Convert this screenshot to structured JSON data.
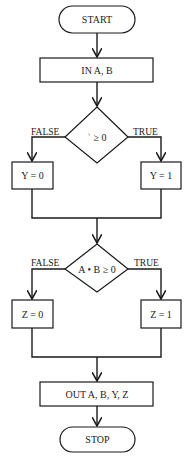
{
  "diagram": {
    "type": "flowchart",
    "nodes": {
      "start": {
        "kind": "terminal",
        "label": "START"
      },
      "input": {
        "kind": "process",
        "label": "IN A, B"
      },
      "decision1": {
        "kind": "decision",
        "label": "ʿ ≥ 0",
        "false_label": "FALSE",
        "true_label": "TRUE"
      },
      "y0": {
        "kind": "process",
        "label": "Y = 0"
      },
      "y1": {
        "kind": "process",
        "label": "Y = 1"
      },
      "decision2": {
        "kind": "decision",
        "label": "A • B ≥ 0",
        "false_label": "FALSE",
        "true_label": "TRUE"
      },
      "z0": {
        "kind": "process",
        "label": "Z = 0"
      },
      "z1": {
        "kind": "process",
        "label": "Z = 1"
      },
      "output": {
        "kind": "process",
        "label": "OUT A, B, Y, Z"
      },
      "stop": {
        "kind": "terminal",
        "label": "STOP"
      }
    },
    "edges": [
      [
        "start",
        "input"
      ],
      [
        "input",
        "decision1"
      ],
      [
        "decision1",
        "y0",
        "FALSE"
      ],
      [
        "decision1",
        "y1",
        "TRUE"
      ],
      [
        "y0",
        "decision2"
      ],
      [
        "y1",
        "decision2"
      ],
      [
        "decision2",
        "z0",
        "FALSE"
      ],
      [
        "decision2",
        "z1",
        "TRUE"
      ],
      [
        "z0",
        "output"
      ],
      [
        "z1",
        "output"
      ],
      [
        "output",
        "stop"
      ]
    ]
  }
}
